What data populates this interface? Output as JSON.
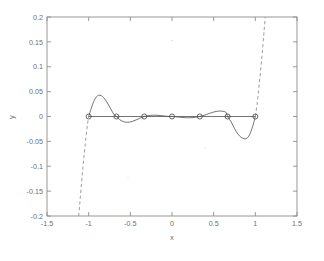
{
  "chart_data": {
    "type": "line",
    "title": "",
    "xlabel": "x",
    "ylabel": "y",
    "xlim": [
      -1.5,
      1.5
    ],
    "ylim": [
      -0.2,
      0.2
    ],
    "xticks": [
      -1.5,
      -1,
      -0.5,
      0,
      0.5,
      1,
      1.5
    ],
    "xticklabels": [
      "-1.5",
      "-1",
      "-0.5",
      "0",
      "0.5",
      "1",
      "1.5"
    ],
    "yticks": [
      -0.2,
      -0.15,
      -0.1,
      -0.05,
      0,
      0.05,
      0.1,
      0.15,
      0.2
    ],
    "yticklabels": [
      "-0.2",
      "-0.15",
      "-0.1",
      "-0.05",
      "0",
      "0.05",
      "0.1",
      "0.15",
      "0.2"
    ],
    "grid": false,
    "legend": null,
    "series": [
      {
        "name": "interpolation-error-inside-interval",
        "style": "solid",
        "color": "#5a5a5a",
        "x": [
          -1.0,
          -0.97,
          -0.94,
          -0.91,
          -0.88,
          -0.85,
          -0.82,
          -0.79,
          -0.76,
          -0.73,
          -0.7,
          -0.667,
          -0.63,
          -0.59,
          -0.55,
          -0.51,
          -0.47,
          -0.43,
          -0.39,
          -0.35,
          -0.333,
          -0.3,
          -0.26,
          -0.22,
          -0.18,
          -0.14,
          -0.1,
          -0.06,
          -0.02,
          0.0,
          0.04,
          0.08,
          0.12,
          0.16,
          0.2,
          0.24,
          0.28,
          0.32,
          0.333,
          0.37,
          0.41,
          0.45,
          0.49,
          0.53,
          0.57,
          0.61,
          0.65,
          0.667,
          0.71,
          0.75,
          0.79,
          0.83,
          0.87,
          0.9,
          0.93,
          0.96,
          0.98,
          1.0
        ],
        "y": [
          0.0,
          0.016,
          0.03,
          0.039,
          0.0425,
          0.042,
          0.038,
          0.031,
          0.023,
          0.014,
          0.005,
          0.0,
          -0.006,
          -0.0098,
          -0.0115,
          -0.0112,
          -0.0095,
          -0.0068,
          -0.0038,
          -0.0011,
          0.0,
          0.0012,
          0.0022,
          0.0026,
          0.0025,
          0.002,
          0.0012,
          0.0004,
          5e-05,
          0.0,
          -0.0005,
          -0.0012,
          -0.0019,
          -0.0024,
          -0.0026,
          -0.0024,
          -0.0017,
          -0.0004,
          0.0,
          0.0016,
          0.0038,
          0.0062,
          0.0085,
          0.0102,
          0.011,
          0.0105,
          0.0082,
          0.0,
          -0.011,
          -0.024,
          -0.035,
          -0.042,
          -0.0448,
          -0.0435,
          -0.037,
          -0.024,
          -0.013,
          0.0
        ]
      },
      {
        "name": "divergence-left-extrapolation",
        "style": "dashed",
        "color": "#8a8a8a",
        "x": [
          -1.12,
          -1.11,
          -1.1,
          -1.085,
          -1.07,
          -1.055,
          -1.04,
          -1.03,
          -1.02,
          -1.01,
          -1.0
        ],
        "y": [
          -0.2,
          -0.182,
          -0.162,
          -0.132,
          -0.104,
          -0.078,
          -0.054,
          -0.038,
          -0.024,
          -0.011,
          0.0
        ]
      },
      {
        "name": "divergence-right-extrapolation",
        "style": "dashed",
        "color": "#8a8a8a",
        "x": [
          1.0,
          1.01,
          1.02,
          1.03,
          1.04,
          1.055,
          1.07,
          1.085,
          1.1,
          1.11,
          1.12
        ],
        "y": [
          0.0,
          0.011,
          0.024,
          0.038,
          0.054,
          0.078,
          0.104,
          0.132,
          0.162,
          0.182,
          0.2
        ]
      },
      {
        "name": "zero-baseline",
        "style": "solid",
        "color": "#5a5a5a",
        "x": [
          -1.0,
          1.0
        ],
        "y": [
          0.0,
          0.0
        ]
      }
    ],
    "markers": {
      "name": "interpolation-nodes",
      "shape": "circle",
      "size": 3.4,
      "x": [
        -1.0,
        -0.6667,
        -0.3333,
        0.0,
        0.3333,
        0.6667,
        1.0
      ],
      "y": [
        0.0,
        0.0,
        0.0,
        0.0,
        0.0,
        0.0,
        0.0
      ]
    }
  }
}
